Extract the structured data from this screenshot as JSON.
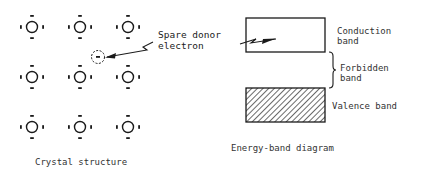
{
  "crystal": {
    "caption": "Crystal structure",
    "atoms": [
      {
        "x": 32,
        "y": 27
      },
      {
        "x": 80,
        "y": 27
      },
      {
        "x": 128,
        "y": 27
      },
      {
        "x": 32,
        "y": 77
      },
      {
        "x": 80,
        "y": 77
      },
      {
        "x": 128,
        "y": 77
      },
      {
        "x": 32,
        "y": 127
      },
      {
        "x": 80,
        "y": 127
      },
      {
        "x": 128,
        "y": 127
      }
    ],
    "donor": {
      "x": 98,
      "y": 57
    }
  },
  "annotation": {
    "line1": "Spare donor",
    "line2": "electron"
  },
  "band_diagram": {
    "caption": "Energy-band diagram",
    "conduction": {
      "line1": "Conduction",
      "line2": "band"
    },
    "forbidden": {
      "line1": "Forbidden",
      "line2": "band"
    },
    "valence": {
      "label": "Valence band"
    }
  },
  "colors": {
    "ink": "#1a1a1a",
    "background": "#ffffff"
  }
}
